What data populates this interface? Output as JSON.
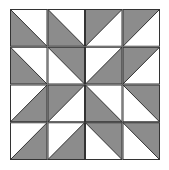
{
  "diagram": {
    "grid": {
      "rows": 4,
      "cols": 4
    },
    "colors": {
      "fill": "#8c8c8c",
      "background": "#ffffff",
      "line": "#333333"
    },
    "cells": [
      [
        {
          "diag": "tlbr",
          "shade": "bl"
        },
        {
          "diag": "tlbr",
          "shade": "bl"
        },
        {
          "diag": "bltr",
          "shade": "tl"
        },
        {
          "diag": "bltr",
          "shade": "tl"
        }
      ],
      [
        {
          "diag": "tlbr",
          "shade": "bl"
        },
        {
          "diag": "tlbr",
          "shade": "tr"
        },
        {
          "diag": "bltr",
          "shade": "br"
        },
        {
          "diag": "bltr",
          "shade": "tl"
        }
      ],
      [
        {
          "diag": "bltr",
          "shade": "br"
        },
        {
          "diag": "bltr",
          "shade": "tl"
        },
        {
          "diag": "tlbr",
          "shade": "bl"
        },
        {
          "diag": "tlbr",
          "shade": "tr"
        }
      ],
      [
        {
          "diag": "bltr",
          "shade": "br"
        },
        {
          "diag": "bltr",
          "shade": "br"
        },
        {
          "diag": "tlbr",
          "shade": "tr"
        },
        {
          "diag": "tlbr",
          "shade": "tr"
        }
      ]
    ]
  }
}
